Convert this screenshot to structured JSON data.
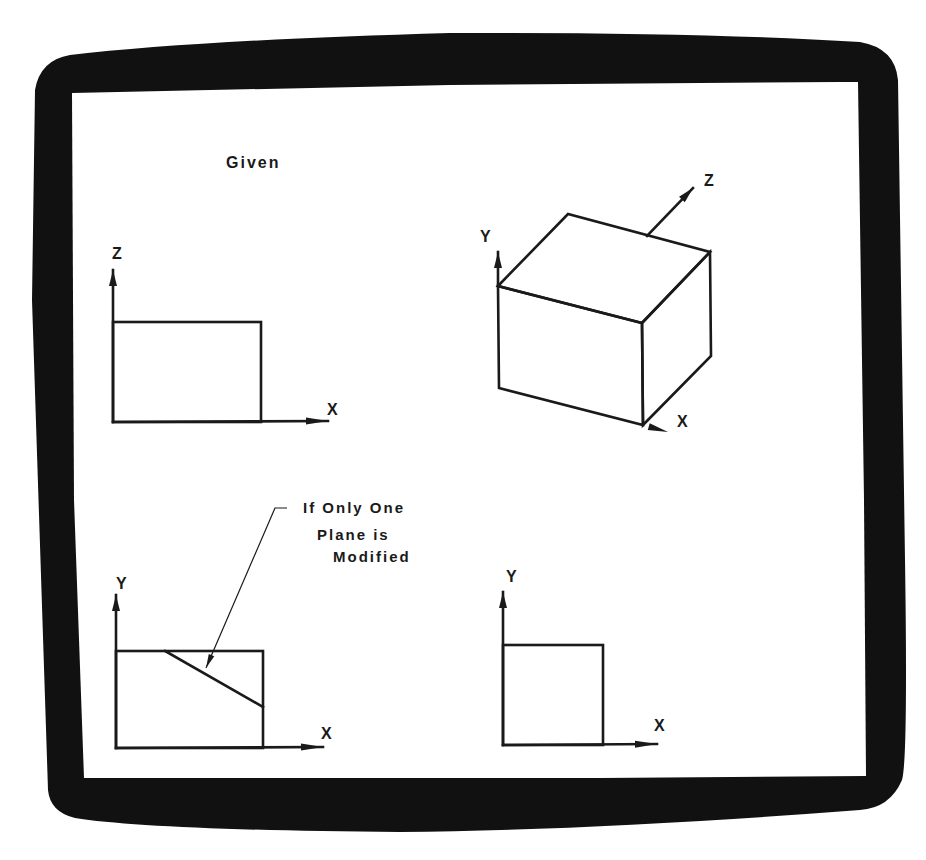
{
  "screen": {
    "bezel_color": "#111111",
    "screen_color": "#ffffff",
    "ink_color": "#1a1a1a"
  },
  "title": {
    "text": "Given",
    "x": 226,
    "y": 168
  },
  "views": {
    "top_left": {
      "name": "XZ plane view (given)",
      "vertical_axis_label": "Z",
      "horizontal_axis_label": "X",
      "origin": [
        113,
        422
      ],
      "vertical_axis_end": [
        113,
        270
      ],
      "horizontal_axis_end": [
        328,
        421
      ],
      "rect": {
        "x": 113,
        "y": 322,
        "w": 148,
        "h": 100
      },
      "v_label_pos": [
        112,
        259
      ],
      "h_label_pos": [
        327,
        415
      ]
    },
    "top_right": {
      "name": "isometric cube (given)",
      "y_axis_label": "Y",
      "z_axis_label": "Z",
      "x_axis_label": "X",
      "vertices": {
        "front_top_left": [
          498,
          286
        ],
        "back_top_left": [
          568,
          214
        ],
        "back_top_right": [
          710,
          252
        ],
        "front_top_right": [
          642,
          323
        ],
        "front_bottom_left": [
          499,
          388
        ],
        "front_bottom_right": [
          643,
          425
        ],
        "back_bottom_right": [
          711,
          356
        ]
      },
      "y_axis": {
        "from": [
          498,
          286
        ],
        "to": [
          498,
          252
        ]
      },
      "z_axis": {
        "from": [
          647,
          236
        ],
        "to": [
          693,
          188
        ]
      },
      "x_axis": {
        "from": [
          643,
          425
        ],
        "to": [
          668,
          432
        ]
      },
      "y_label_pos": [
        480,
        242
      ],
      "z_label_pos": [
        704,
        186
      ],
      "x_label_pos": [
        677,
        427
      ]
    },
    "bottom_left": {
      "name": "XY plane view (modified)",
      "vertical_axis_label": "Y",
      "horizontal_axis_label": "X",
      "origin": [
        116,
        748
      ],
      "vertical_axis_end": [
        116,
        595
      ],
      "horizontal_axis_end": [
        323,
        747
      ],
      "rect": {
        "x": 116,
        "y": 651,
        "w": 147,
        "h": 97
      },
      "diagonal": {
        "from": [
          165,
          651
        ],
        "to": [
          263,
          707
        ]
      },
      "leader": {
        "from": [
          206,
          668
        ],
        "to": [
          275,
          508
        ],
        "tick_to": [
          287,
          508
        ]
      },
      "v_label_pos": [
        116,
        589
      ],
      "h_label_pos": [
        321,
        739
      ]
    },
    "bottom_right": {
      "name": "XY plane view (unmodified)",
      "vertical_axis_label": "Y",
      "horizontal_axis_label": "X",
      "origin": [
        503,
        745
      ],
      "vertical_axis_end": [
        503,
        592
      ],
      "horizontal_axis_end": [
        657,
        744
      ],
      "rect": {
        "x": 503,
        "y": 645,
        "w": 100,
        "h": 100
      },
      "v_label_pos": [
        506,
        582
      ],
      "h_label_pos": [
        654,
        731
      ]
    }
  },
  "annotation": {
    "lines": [
      "If Only One",
      "Plane is",
      "Modified"
    ],
    "positions": [
      [
        303,
        513
      ],
      [
        317,
        540
      ],
      [
        333,
        562
      ]
    ]
  }
}
